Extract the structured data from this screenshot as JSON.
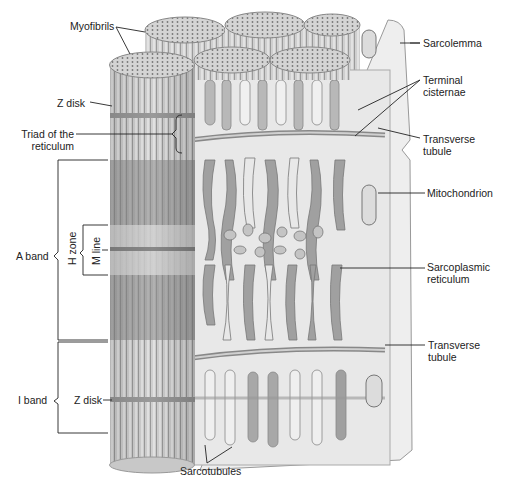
{
  "diagram": {
    "labels": {
      "myofibrils": "Myofibrils",
      "sarcolemma": "Sarcolemma",
      "z_disk_top": "Z disk",
      "terminal_cisternae_1": "Terminal",
      "terminal_cisternae_2": "cisternae",
      "triad_1": "Triad of the",
      "triad_2": "reticulum",
      "transverse_tubule_top_1": "Transverse",
      "transverse_tubule_top_2": "tubule",
      "mitochondrion": "Mitochondrion",
      "a_band": "A band",
      "h_zone": "H zone",
      "m_line": "M line",
      "sarcoplasmic_reticulum_1": "Sarcoplasmic",
      "sarcoplasmic_reticulum_2": "reticulum",
      "transverse_tubule_bottom_1": "Transverse",
      "transverse_tubule_bottom_2": "tubule",
      "i_band": "I band",
      "z_disk_bottom": "Z disk",
      "sarcotubules": "Sarcotubules"
    },
    "colors": {
      "light": "#e4e4e4",
      "mid": "#c2c2c2",
      "dark": "#8e8e8e",
      "line": "#333333"
    }
  }
}
